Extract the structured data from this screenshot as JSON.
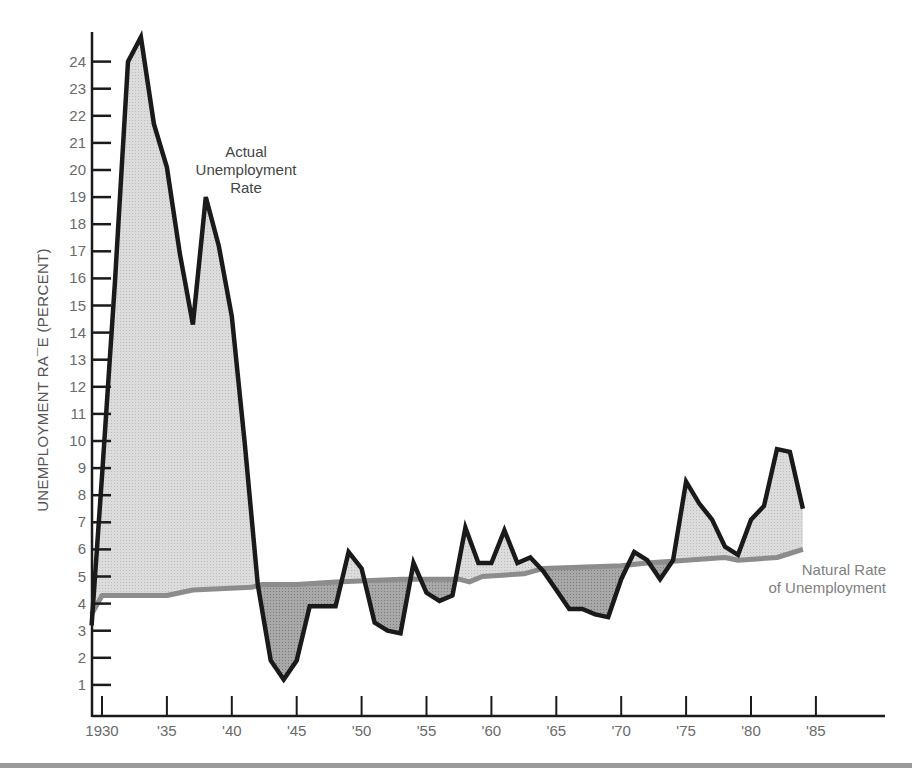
{
  "chart_data": {
    "type": "area",
    "title": "",
    "xlabel": "",
    "ylabel": "UNEMPLOYMENT RA¯E (PERCENT)",
    "xlim": [
      1929,
      1991
    ],
    "ylim": [
      0,
      25
    ],
    "grid": false,
    "x_ticks": [
      {
        "year": 1930,
        "label": "1930"
      },
      {
        "year": 1935,
        "label": "'35"
      },
      {
        "year": 1940,
        "label": "'40"
      },
      {
        "year": 1945,
        "label": "'45"
      },
      {
        "year": 1950,
        "label": "'50"
      },
      {
        "year": 1955,
        "label": "'55"
      },
      {
        "year": 1960,
        "label": "'60"
      },
      {
        "year": 1965,
        "label": "'65"
      },
      {
        "year": 1970,
        "label": "'70"
      },
      {
        "year": 1975,
        "label": "'75"
      },
      {
        "year": 1980,
        "label": "'80"
      },
      {
        "year": 1985,
        "label": "'85"
      }
    ],
    "y_ticks": [
      1,
      2,
      3,
      4,
      5,
      6,
      7,
      8,
      9,
      10,
      11,
      12,
      13,
      14,
      15,
      16,
      17,
      18,
      19,
      20,
      21,
      22,
      23,
      24
    ],
    "series": [
      {
        "name": "Actual Unemployment Rate",
        "color": "#1a1a1a",
        "points": [
          [
            1929.2,
            3.2
          ],
          [
            1930,
            8.7
          ],
          [
            1931,
            15.9
          ],
          [
            1932,
            24.0
          ],
          [
            1933,
            24.9
          ],
          [
            1934,
            21.7
          ],
          [
            1935,
            20.1
          ],
          [
            1936,
            16.9
          ],
          [
            1937,
            14.3
          ],
          [
            1938,
            19.0
          ],
          [
            1939,
            17.2
          ],
          [
            1940,
            14.6
          ],
          [
            1941,
            9.9
          ],
          [
            1942,
            4.7
          ],
          [
            1943,
            1.9
          ],
          [
            1944,
            1.2
          ],
          [
            1945,
            1.9
          ],
          [
            1946,
            3.9
          ],
          [
            1947,
            3.9
          ],
          [
            1948,
            3.9
          ],
          [
            1949,
            5.9
          ],
          [
            1950,
            5.3
          ],
          [
            1951,
            3.3
          ],
          [
            1952,
            3.0
          ],
          [
            1953,
            2.9
          ],
          [
            1954,
            5.5
          ],
          [
            1955,
            4.4
          ],
          [
            1956,
            4.1
          ],
          [
            1957,
            4.3
          ],
          [
            1958,
            6.8
          ],
          [
            1959,
            5.5
          ],
          [
            1960,
            5.5
          ],
          [
            1961,
            6.7
          ],
          [
            1962,
            5.5
          ],
          [
            1963,
            5.7
          ],
          [
            1964,
            5.2
          ],
          [
            1965,
            4.5
          ],
          [
            1966,
            3.8
          ],
          [
            1967,
            3.8
          ],
          [
            1968,
            3.6
          ],
          [
            1969,
            3.5
          ],
          [
            1970,
            4.9
          ],
          [
            1971,
            5.9
          ],
          [
            1972,
            5.6
          ],
          [
            1973,
            4.9
          ],
          [
            1974,
            5.6
          ],
          [
            1975,
            8.5
          ],
          [
            1976,
            7.7
          ],
          [
            1977,
            7.1
          ],
          [
            1978,
            6.1
          ],
          [
            1979,
            5.8
          ],
          [
            1980,
            7.1
          ],
          [
            1981,
            7.6
          ],
          [
            1982,
            9.7
          ],
          [
            1983,
            9.6
          ],
          [
            1984,
            7.5
          ]
        ]
      },
      {
        "name": "Natural Rate of Unemployment",
        "color": "#8c8c8c",
        "points": [
          [
            1929.2,
            3.6
          ],
          [
            1930,
            4.3
          ],
          [
            1935,
            4.3
          ],
          [
            1936,
            4.4
          ],
          [
            1937,
            4.5
          ],
          [
            1941.5,
            4.6
          ],
          [
            1942.3,
            4.7
          ],
          [
            1945,
            4.7
          ],
          [
            1948,
            4.8
          ],
          [
            1953,
            4.9
          ],
          [
            1957.5,
            4.9
          ],
          [
            1958.3,
            4.8
          ],
          [
            1959.3,
            5.0
          ],
          [
            1962.5,
            5.1
          ],
          [
            1964,
            5.3
          ],
          [
            1970,
            5.4
          ],
          [
            1972,
            5.5
          ],
          [
            1975,
            5.6
          ],
          [
            1978,
            5.7
          ],
          [
            1979,
            5.6
          ],
          [
            1982,
            5.7
          ],
          [
            1984,
            6.0
          ]
        ]
      }
    ],
    "annotations": [
      {
        "text": [
          "Actual",
          "Unemployment",
          "Rate"
        ],
        "x_px": 246,
        "y_px": 157
      },
      {
        "text": [
          "Natural Rate",
          "of Unemployment"
        ],
        "x_px": 886,
        "y_px": 575
      }
    ],
    "fill_colors": {
      "above_natural": "#d4d4d4",
      "below_natural": "#9e9e9e"
    },
    "axis_color": "#1a1a1a"
  }
}
